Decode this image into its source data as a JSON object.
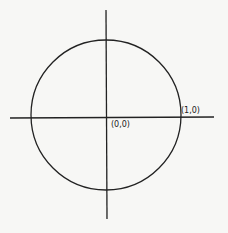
{
  "diagram": {
    "labels": {
      "origin": "(0,0)",
      "point_on_x_axis": "(1,0)"
    },
    "colors": {
      "ink": "#222222",
      "paper": "#f7f7f5"
    }
  }
}
